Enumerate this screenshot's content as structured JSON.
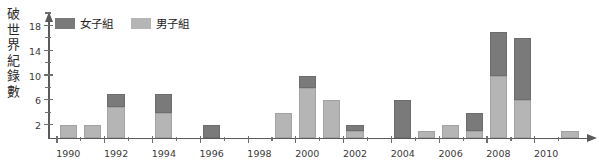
{
  "chart_data": {
    "type": "bar",
    "title": "",
    "subtitle": "",
    "stacked": true,
    "xlabel": "",
    "ylabel": "破世界紀錄數",
    "ylabel_chars": "破\n世\n界\n紀\n錄\n數",
    "ylim": [
      0,
      20
    ],
    "ytick_values": [
      2,
      6,
      10,
      14,
      18
    ],
    "ytick_labels": [
      "2",
      "6",
      "10",
      "14",
      "18"
    ],
    "yminor_values": [
      4,
      8,
      12,
      16,
      20
    ],
    "grid": false,
    "legend_position": "top-left",
    "colors": {
      "women": "#7a7a7a",
      "men": "#b5b5b5",
      "axis": "#5a5a5a",
      "text": "#3a3a3a",
      "background": "#ffffff"
    },
    "categories": [
      1990,
      1991,
      1992,
      1993,
      1994,
      1995,
      1996,
      1997,
      1998,
      1999,
      2000,
      2001,
      2002,
      2003,
      2004,
      2005,
      2006,
      2007,
      2008,
      2009,
      2010,
      2011
    ],
    "xtick_labels": [
      "1990",
      "1992",
      "1994",
      "1996",
      "1998",
      "2000",
      "2002",
      "2004",
      "2006",
      "2008",
      "2010"
    ],
    "xtick_values": [
      1990,
      1992,
      1994,
      1996,
      1998,
      2000,
      2002,
      2004,
      2006,
      2008,
      2010
    ],
    "series": [
      {
        "name": "男子組",
        "key": "men",
        "color": "#b5b5b5",
        "values": [
          2,
          2,
          5,
          0,
          4,
          0,
          0,
          0,
          0,
          4,
          8,
          6,
          1,
          0,
          0,
          1,
          2,
          1,
          10,
          6,
          0,
          1
        ]
      },
      {
        "name": "女子組",
        "key": "women",
        "color": "#7a7a7a",
        "values": [
          0,
          0,
          2,
          0,
          3,
          0,
          2,
          0,
          0,
          0,
          2,
          0,
          1,
          0,
          6,
          0,
          0,
          3,
          7,
          10,
          0,
          0
        ]
      }
    ],
    "totals": [
      2,
      2,
      7,
      0,
      7,
      0,
      2,
      0,
      0,
      4,
      10,
      6,
      2,
      0,
      6,
      1,
      2,
      4,
      17,
      16,
      0,
      1
    ]
  },
  "legend": {
    "items": [
      {
        "label": "女子組",
        "swatch": "women"
      },
      {
        "label": "男子組",
        "swatch": "men"
      }
    ]
  }
}
